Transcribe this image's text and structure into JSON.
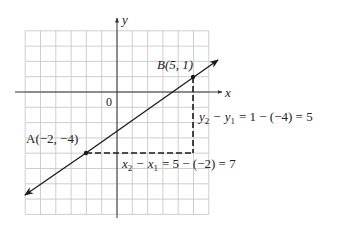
{
  "axes": {
    "x_label": "x",
    "y_label": "y",
    "origin_label": "0",
    "x_range": [
      -6,
      6
    ],
    "y_range": [
      -8,
      4
    ],
    "grid": true
  },
  "points": {
    "A": {
      "label": "A(−2, −4)",
      "x": -2,
      "y": -4
    },
    "B": {
      "label": "B(5, 1)",
      "x": 5,
      "y": 1
    }
  },
  "annotations": {
    "rise": {
      "lhs_var1": "y",
      "lhs_sub1": "2",
      "lhs_var2": "y",
      "lhs_sub2": "1",
      "rhs": "= 1 − (−4) = 5",
      "minus": "−"
    },
    "run": {
      "lhs_var1": "x",
      "lhs_sub1": "2",
      "lhs_var2": "x",
      "lhs_sub2": "1",
      "rhs": "= 5 − (−2) = 7",
      "minus": "−"
    }
  },
  "colors": {
    "grid": "#c8c8c8",
    "axis": "#333333",
    "line": "#1a1a1a",
    "dashed": "#1a1a1a"
  }
}
